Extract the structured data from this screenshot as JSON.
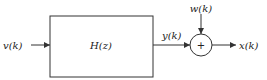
{
  "diagram": {
    "input_label": "v(k)",
    "block_label": "H(z)",
    "block_output_label": "y(k)",
    "noise_label": "w(k)",
    "summer_symbol": "+",
    "output_label": "x(k)",
    "colors": {
      "line": "#333333",
      "background": "#ffffff"
    }
  }
}
